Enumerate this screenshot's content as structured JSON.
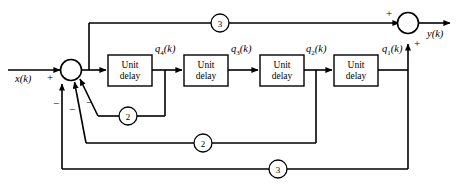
{
  "diagram": {
    "input": {
      "label": "x(k)",
      "sign": "+"
    },
    "output": {
      "label": "y(k)"
    },
    "blocks": [
      {
        "id": "delay4",
        "line1": "Unit",
        "line2": "delay",
        "output_label": "q4(k)"
      },
      {
        "id": "delay3",
        "line1": "Unit",
        "line2": "delay",
        "output_label": "q3(k)"
      },
      {
        "id": "delay2",
        "line1": "Unit",
        "line2": "delay",
        "output_label": "q2(k)"
      },
      {
        "id": "delay1",
        "line1": "Unit",
        "line2": "delay",
        "output_label": "q1(k)"
      }
    ],
    "gains": [
      {
        "id": "gain-top-3",
        "value": "3",
        "path": "forward-top"
      },
      {
        "id": "gain-2-upper",
        "value": "2",
        "path": "feedback-q4"
      },
      {
        "id": "gain-2-lower",
        "value": "2",
        "path": "feedback-q2"
      },
      {
        "id": "gain-bottom-3",
        "value": "3",
        "path": "feedback-q1"
      }
    ],
    "summing_junction_input": {
      "id": "sum-input",
      "signs": [
        "+",
        "−",
        "−",
        "−"
      ]
    },
    "summing_junction_output": {
      "id": "sum-output",
      "signs": [
        "+",
        "+"
      ]
    },
    "signal_labels": [
      "q4(k)",
      "q3(k)",
      "q2(k)",
      "q1(k)"
    ],
    "colors": {
      "line": "#000000",
      "background": "#ffffff"
    }
  }
}
